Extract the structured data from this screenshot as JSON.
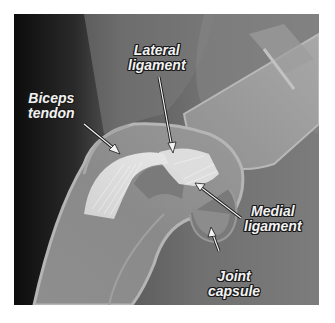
{
  "image": {
    "description": "Radiograph of a joint with annotated soft-tissue structures",
    "labels": [
      {
        "id": "biceps-tendon",
        "lines": [
          "Biceps",
          "tendon"
        ]
      },
      {
        "id": "lateral-ligament",
        "lines": [
          "Lateral",
          "ligament"
        ]
      },
      {
        "id": "medial-ligament",
        "lines": [
          "Medial",
          "ligament"
        ]
      },
      {
        "id": "joint-capsule",
        "lines": [
          "Joint",
          "capsule"
        ]
      }
    ]
  }
}
